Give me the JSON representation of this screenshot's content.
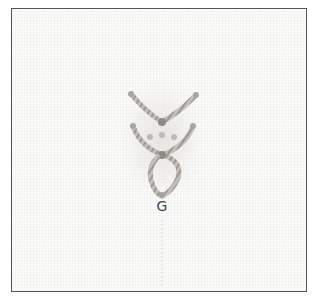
{
  "figure": {
    "step_label": "G",
    "colors": {
      "frame_border": "#555555",
      "fabric": "#fbfbfa",
      "thread": "#b9b4ad",
      "thread_shadow": "#8f8a84",
      "guide_line": "#c8c8c8",
      "label": "#444444"
    }
  }
}
